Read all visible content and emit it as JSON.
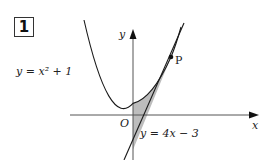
{
  "problem": {
    "number": "1"
  },
  "axes": {
    "x_label": "x",
    "y_label": "y",
    "origin_label": "O"
  },
  "curves": {
    "parabola": {
      "label": "y = x² + 1",
      "equation": "y = x^2 + 1"
    },
    "tangent": {
      "label": "y = 4x − 3",
      "equation": "y = 4x - 3"
    }
  },
  "point": {
    "label": "P",
    "coords": [
      2,
      5
    ]
  },
  "shaded_region": {
    "description": "region between y = x^2 + 1, tangent y = 4x - 3, and the y-axis",
    "color": "#bdbdbd"
  },
  "colors": {
    "stroke": "#1a1a1a",
    "axis": "#555555",
    "shade": "#bdbdbd"
  }
}
